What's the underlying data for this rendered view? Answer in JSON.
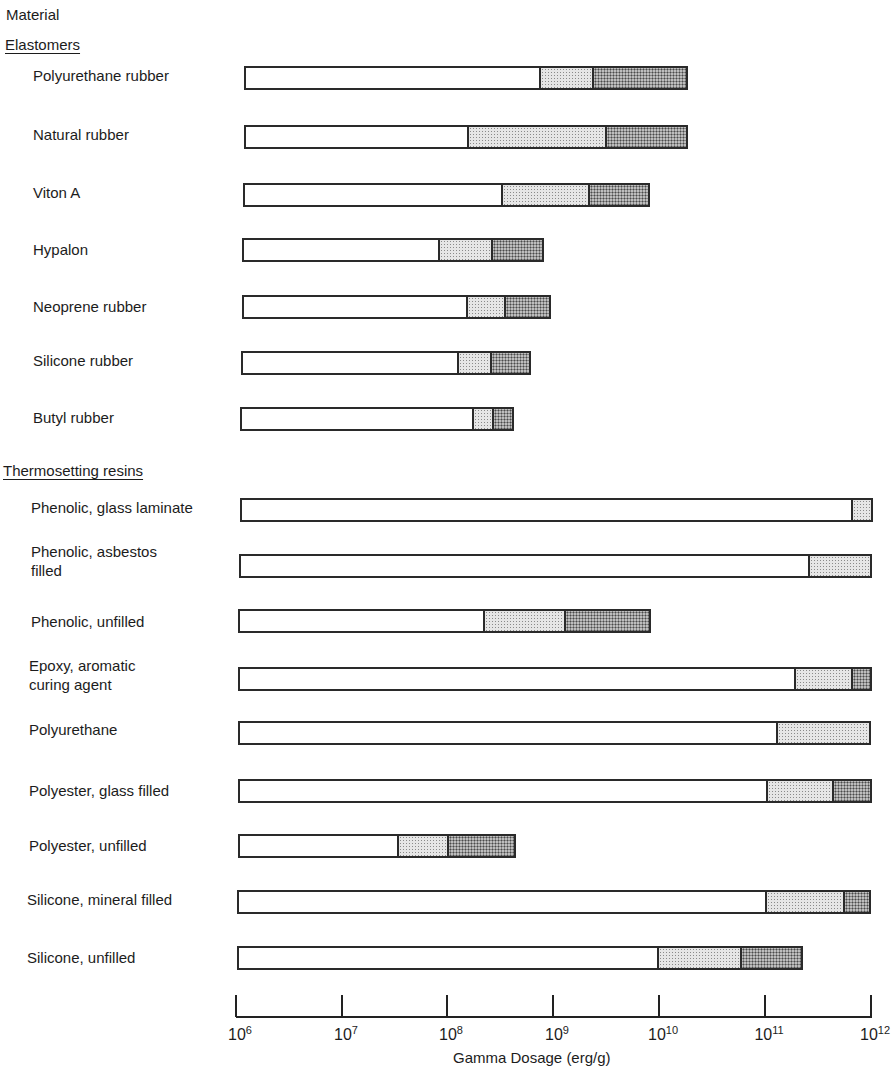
{
  "chart_data": {
    "type": "bar",
    "orientation": "horizontal",
    "subtype": "stacked-range",
    "title": "",
    "ylabel": "Material",
    "xlabel": "Gamma Dosage (erg/g)",
    "xscale": "log",
    "xlim": [
      1000000.0,
      1000000000000.0
    ],
    "xticks": [
      "10^6",
      "10^7",
      "10^8",
      "10^9",
      "10^10",
      "10^11",
      "10^12"
    ],
    "segments_legend": [
      "no/slight effect (white)",
      "moderate effect (light stipple)",
      "severe effect (dark stipple)"
    ],
    "groups": [
      {
        "name": "Elastomers",
        "materials": [
          {
            "name": "Polyurethane rubber",
            "start": 1200000.0,
            "light_from": 700000000.0,
            "dark_from": 2200000000.0,
            "end": 18000000000.0
          },
          {
            "name": "Natural rubber",
            "start": 1200000.0,
            "light_from": 130000000.0,
            "dark_from": 2600000000.0,
            "end": 18000000000.0
          },
          {
            "name": "Viton A",
            "start": 1200000.0,
            "light_from": 280000000.0,
            "dark_from": 1800000000.0,
            "end": 6700000000.0
          },
          {
            "name": "Hypalon",
            "start": 1100000.0,
            "light_from": 80000000.0,
            "dark_from": 250000000.0,
            "end": 800000000.0
          },
          {
            "name": "Neoprene rubber",
            "start": 1100000.0,
            "light_from": 130000000.0,
            "dark_from": 340000000.0,
            "end": 940000000.0
          },
          {
            "name": "Silicone rubber",
            "start": 1100000.0,
            "light_from": 110000000.0,
            "dark_from": 220000000.0,
            "end": 530000000.0
          },
          {
            "name": "Butyl rubber",
            "start": 1000000.0,
            "light_from": 170000000.0,
            "dark_from": 260000000.0,
            "end": 420000000.0
          }
        ]
      },
      {
        "name": "Thermosetting resins",
        "materials": [
          {
            "name": "Phenolic, glass laminate",
            "start": 1000000.0,
            "light_from": 640000000000.0,
            "dark_from": null,
            "end": 1000000000000.0
          },
          {
            "name": "Phenolic, asbestos\nfilled",
            "start": 1000000.0,
            "light_from": 250000000000.0,
            "dark_from": null,
            "end": 1000000000000.0
          },
          {
            "name": "Phenolic, unfilled",
            "start": 1000000.0,
            "light_from": 220000000.0,
            "dark_from": 1300000000.0,
            "end": 8700000000.0
          },
          {
            "name": "Epoxy, aromatic\ncuring agent",
            "start": 1000000.0,
            "light_from": 180000000000.0,
            "dark_from": 640000000000.0,
            "end": 1000000000000.0
          },
          {
            "name": "Polyurethane",
            "start": 1000000.0,
            "light_from": 120000000000.0,
            "dark_from": null,
            "end": 1000000000000.0
          },
          {
            "name": "Polyester, glass filled",
            "start": 1000000.0,
            "light_from": 100000000000.0,
            "dark_from": 420000000000.0,
            "end": 1000000000000.0
          },
          {
            "name": "Polyester, unfilled",
            "start": 1000000.0,
            "light_from": 33000000.0,
            "dark_from": 99000000.0,
            "end": 450000000.0
          },
          {
            "name": "Silicone, mineral filled",
            "start": 1000000.0,
            "light_from": 100000000000.0,
            "dark_from": 550000000000.0,
            "end": 1000000000000.0
          },
          {
            "name": "Silicone, unfilled",
            "start": 1000000.0,
            "light_from": 10000000000.0,
            "dark_from": 60000000000.0,
            "end": 230000000000.0
          }
        ]
      }
    ]
  },
  "labels": {
    "header": "Material",
    "groups": [
      "Elastomers",
      "Thermosetting resins"
    ],
    "rows": [
      "Polyurethane rubber",
      "Natural  rubber",
      "Viton  A",
      "Hypalon",
      "Neoprene  rubber",
      "Silicone  rubber",
      "Butyl  rubber",
      "Phenolic,  glass laminate",
      "Phenolic,  asbestos\n filled",
      "Phenolic,  unfilled",
      "Epoxy,  aromatic\n curing agent",
      "Polyurethane",
      "Polyester,  glass filled",
      "Polyester,  unfilled",
      "Silicone,  mineral filled",
      "Silicone,  unfilled"
    ],
    "xlabel": "Gamma Dosage (erg/g)",
    "ticks": [
      {
        "base": "10",
        "exp": "6"
      },
      {
        "base": "10",
        "exp": "7"
      },
      {
        "base": "10",
        "exp": "8"
      },
      {
        "base": "10",
        "exp": "9"
      },
      {
        "base": "10",
        "exp": "10"
      },
      {
        "base": "10",
        "exp": "11"
      },
      {
        "base": "10",
        "exp": "12"
      }
    ]
  },
  "layout": {
    "rows": [
      {
        "label_x": 33,
        "label_y": 66,
        "bar_y": 66,
        "px": [
          244,
          539,
          592,
          688
        ]
      },
      {
        "label_x": 33,
        "label_y": 125,
        "bar_y": 125,
        "px": [
          244,
          467,
          605,
          688
        ]
      },
      {
        "label_x": 33,
        "label_y": 183,
        "bar_y": 183,
        "px": [
          243,
          501,
          588,
          650
        ]
      },
      {
        "label_x": 33,
        "label_y": 240,
        "bar_y": 238,
        "px": [
          242,
          438,
          491,
          544
        ]
      },
      {
        "label_x": 33,
        "label_y": 297,
        "bar_y": 295,
        "px": [
          242,
          466,
          504,
          551
        ]
      },
      {
        "label_x": 33,
        "label_y": 351,
        "bar_y": 351,
        "px": [
          241,
          457,
          490,
          531
        ]
      },
      {
        "label_x": 33,
        "label_y": 408,
        "bar_y": 407,
        "px": [
          240,
          472,
          492,
          514
        ]
      },
      {
        "label_x": 31,
        "label_y": 498,
        "bar_y": 498,
        "px": [
          240,
          851,
          null,
          873
        ]
      },
      {
        "label_x": 31,
        "label_y": 542,
        "bar_y": 554,
        "px": [
          239,
          808,
          null,
          872
        ]
      },
      {
        "label_x": 31,
        "label_y": 612,
        "bar_y": 609,
        "px": [
          238,
          483,
          564,
          651
        ]
      },
      {
        "label_x": 29,
        "label_y": 656,
        "bar_y": 667,
        "px": [
          238,
          794,
          851,
          872
        ]
      },
      {
        "label_x": 29,
        "label_y": 720,
        "bar_y": 721,
        "px": [
          238,
          776,
          null,
          871
        ]
      },
      {
        "label_x": 29,
        "label_y": 781,
        "bar_y": 779,
        "px": [
          238,
          766,
          832,
          872
        ]
      },
      {
        "label_x": 29,
        "label_y": 836,
        "bar_y": 834,
        "px": [
          238,
          397,
          447,
          516
        ]
      },
      {
        "label_x": 27,
        "label_y": 890,
        "bar_y": 890,
        "px": [
          237,
          765,
          843,
          871
        ]
      },
      {
        "label_x": 27,
        "label_y": 948,
        "bar_y": 946,
        "px": [
          237,
          657,
          740,
          803
        ]
      }
    ],
    "tick_x": [
      236,
      342,
      447,
      553,
      659,
      765,
      871
    ]
  }
}
